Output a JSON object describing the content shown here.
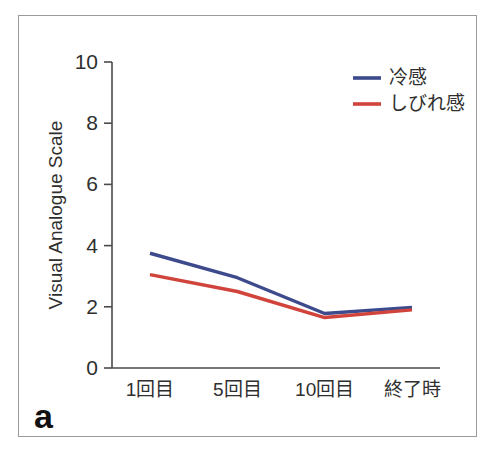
{
  "figure": {
    "panel_letter": "a",
    "border_color": "#9a9a9a",
    "background": "#ffffff"
  },
  "chart_data": {
    "type": "line",
    "title": "",
    "subtitle": "",
    "xlabel": "",
    "ylabel": "Visual Analogue Scale",
    "categories": [
      "1回目",
      "5回目",
      "10回目",
      "終了時"
    ],
    "series": [
      {
        "name": "冷感",
        "color": "#3d4a8c",
        "values": [
          3.75,
          2.95,
          1.78,
          1.98
        ]
      },
      {
        "name": "しびれ感",
        "color": "#d1443c",
        "values": [
          3.05,
          2.5,
          1.65,
          1.9
        ]
      }
    ],
    "ylim": [
      0,
      10
    ],
    "yticks": [
      0,
      2,
      4,
      6,
      8,
      10
    ],
    "ytick_labels": [
      "0",
      "2",
      "4",
      "6",
      "8",
      "10"
    ],
    "xtick_labels": [
      "1回目",
      "5回目",
      "10回目",
      "終了時"
    ],
    "grid": false,
    "legend_position": "top-right",
    "legend_entries": [
      {
        "label": "冷感",
        "color": "#3d4a8c"
      },
      {
        "label": "しびれ感",
        "color": "#d1443c"
      }
    ],
    "markers": false,
    "axis_color": "#4a4a4a"
  }
}
